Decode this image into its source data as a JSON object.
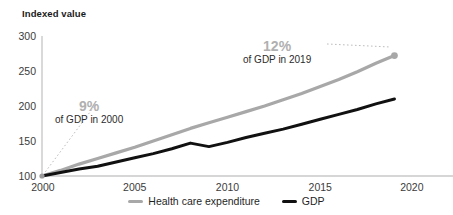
{
  "chart_data": {
    "type": "line",
    "title": "",
    "subtitle": "",
    "xlabel": "",
    "ylabel": "Indexed value",
    "xlim": [
      2000,
      2020
    ],
    "ylim": [
      100,
      300
    ],
    "grid": false,
    "legend_position": "bottom-center",
    "x": [
      2000,
      2001,
      2002,
      2003,
      2004,
      2005,
      2006,
      2007,
      2008,
      2009,
      2010,
      2011,
      2012,
      2013,
      2014,
      2015,
      2016,
      2017,
      2018,
      2019
    ],
    "xticks": [
      "2000",
      "2005",
      "2010",
      "2015",
      "2020"
    ],
    "xtick_values": [
      2000,
      2005,
      2010,
      2015,
      2020
    ],
    "yticks": [
      "100",
      "150",
      "200",
      "250",
      "300"
    ],
    "ytick_values": [
      100,
      150,
      200,
      250,
      300
    ],
    "series": [
      {
        "name": "Health care expenditure",
        "color": "#a8a8a8",
        "values": [
          100,
          108,
          117,
          125,
          133,
          141,
          150,
          159,
          168,
          176,
          184,
          192,
          200,
          209,
          218,
          228,
          238,
          249,
          261,
          272
        ],
        "end_marker": true
      },
      {
        "name": "GDP",
        "color": "#111111",
        "values": [
          100,
          105,
          110,
          114,
          120,
          126,
          132,
          139,
          147,
          142,
          148,
          155,
          161,
          167,
          174,
          181,
          188,
          195,
          203,
          210
        ],
        "end_marker": false
      }
    ],
    "annotations": [
      {
        "id": "left",
        "percent": "9%",
        "caption": "of GDP in 2000",
        "points_to_year": 2000,
        "points_to_value": 100,
        "leader": "dotted-diagonal"
      },
      {
        "id": "right",
        "percent": "12%",
        "caption": "of GDP in 2019",
        "points_to_year": 2019,
        "points_to_value": 272,
        "leader": "dotted-horizontal"
      }
    ]
  },
  "legend": {
    "items": [
      {
        "label": "Health care expenditure",
        "color": "#a8a8a8"
      },
      {
        "label": "GDP",
        "color": "#111111"
      }
    ]
  },
  "axis": {
    "y_title": "Indexed value"
  }
}
